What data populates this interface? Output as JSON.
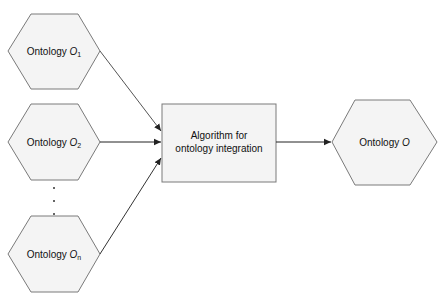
{
  "diagram": {
    "inputs": [
      {
        "label": "Ontology",
        "symbol": "O",
        "subscript": "1"
      },
      {
        "label": "Ontology",
        "symbol": "O",
        "subscript": "2"
      },
      {
        "label": "Ontology",
        "symbol": "O",
        "subscript": "n"
      }
    ],
    "ellipsis": "⋮",
    "process": {
      "line1": "Algorithm for",
      "line2": "ontology integration"
    },
    "output": {
      "label": "Ontology",
      "symbol": "O"
    },
    "colors": {
      "stroke": "#7a7a7a",
      "fill": "#f4f4f4",
      "arrow": "#222222",
      "text": "#111111"
    }
  }
}
